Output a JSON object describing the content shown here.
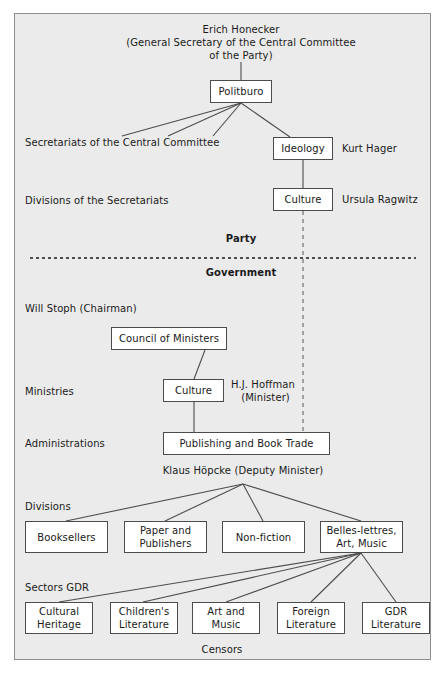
{
  "figure": {
    "title_text": "Erich Honecker",
    "background_color": "#ebebeb",
    "panel_border_color": "#8e8e8e",
    "node_border_color": "#4c4c4c",
    "node_fill_color": "#ffffff"
  },
  "top": {
    "leader_line1": "Erich Honecker",
    "leader_line2": "(General Secretary of the Central Committee",
    "leader_line3": "of the Party)"
  },
  "party": {
    "section_label": "Party",
    "politburo": "Politburo",
    "secretariats_label": "Secretariats of the Central Committee",
    "divisions_label": "Divisions of the Secretariats",
    "ideology": "Ideology",
    "ideology_person": "Kurt Hager",
    "culture": "Culture",
    "culture_person": "Ursula Ragwitz"
  },
  "government": {
    "section_label": "Government",
    "chairman": "Will Stoph (Chairman)",
    "council_of_ministers": "Council of Ministers",
    "ministries_label": "Ministries",
    "culture_ministry": "Culture",
    "minister_line1": "H.J. Hoffman",
    "minister_line2": "(Minister)",
    "administrations_label": "Administrations",
    "publishing": "Publishing and Book Trade",
    "deputy_minister": "Klaus Höpcke (Deputy Minister)"
  },
  "divisions": {
    "row_label": "Divisions",
    "items": [
      {
        "label": "Booksellers"
      },
      {
        "label": "Paper and\nPublishers"
      },
      {
        "label": "Non-fiction"
      },
      {
        "label": "Belles-lettres,\nArt, Music"
      }
    ]
  },
  "sectors": {
    "row_label": "Sectors GDR",
    "footer_label": "Censors",
    "items": [
      {
        "label": "Cultural\nHeritage"
      },
      {
        "label": "Children's\nLiterature"
      },
      {
        "label": "Art and\nMusic"
      },
      {
        "label": "Foreign\nLiterature"
      },
      {
        "label": "GDR\nLiterature"
      }
    ]
  }
}
